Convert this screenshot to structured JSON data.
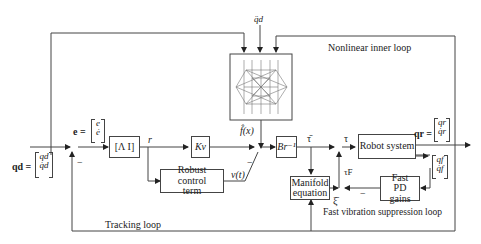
{
  "diagram": {
    "inputs": {
      "qdd_desired": "q̈d",
      "qd_label": "qd =",
      "qd_vector": [
        "qd",
        "q̇d"
      ],
      "e_label": "e =",
      "e_vector": [
        "e",
        "ė"
      ]
    },
    "blocks": {
      "lambda_i": "[Λ   I]",
      "kv": "Kv",
      "robust_control": "Robust control term",
      "neural_network_output": "f̂(x)",
      "br_inverse": "Br⁻¹",
      "robot_system": "Robot system",
      "manifold_equation": "Manifold equation",
      "fast_pd_gains": "Fast PD gains"
    },
    "signals": {
      "r": "r",
      "v_t": "v(t)",
      "tau_bar": "τ̄",
      "tau": "τ",
      "tau_f": "τF",
      "xi_bar": "ξ̄",
      "qr_label": "qr =",
      "qr_vector": [
        "qr",
        "q̇r"
      ],
      "qf_vector": [
        "qf",
        "q̇f"
      ],
      "minus_sign": "−"
    },
    "loops": {
      "nonlinear_inner": "Nonlinear inner loop",
      "tracking": "Tracking loop",
      "fast_vibration": "Fast vibration suppression loop"
    }
  }
}
